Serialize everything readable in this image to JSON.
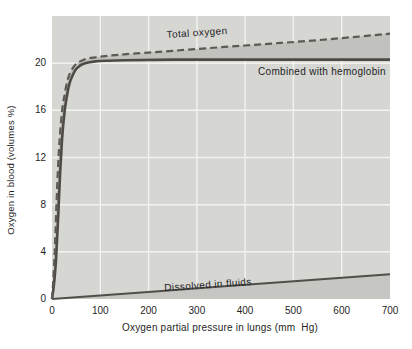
{
  "chart_data": {
    "type": "line",
    "title": "",
    "xlabel": "Oxygen partial pressure in lungs (mm  Hg)",
    "ylabel": "Oxygen in blood (volumes %)",
    "xlim": [
      0,
      700
    ],
    "ylim": [
      0,
      24
    ],
    "x_ticks": [
      0,
      100,
      200,
      300,
      400,
      500,
      600,
      700
    ],
    "y_ticks": [
      0,
      4,
      8,
      12,
      16,
      20
    ],
    "grid": true,
    "legend_position": "inline-curve-labels",
    "series": [
      {
        "name": "Total oxygen",
        "style": "dashed",
        "points": [
          [
            0,
            0
          ],
          [
            2.5,
            1.5
          ],
          [
            5,
            3.5
          ],
          [
            7,
            5.5
          ],
          [
            9,
            7.7
          ],
          [
            11,
            9.8
          ],
          [
            13,
            11.6
          ],
          [
            15,
            13
          ],
          [
            17,
            14.2
          ],
          [
            20,
            15.6
          ],
          [
            23,
            16.6
          ],
          [
            26,
            17.3
          ],
          [
            30,
            18.2
          ],
          [
            34,
            18.8
          ],
          [
            39,
            19.3
          ],
          [
            45,
            19.7
          ],
          [
            52,
            20.0
          ],
          [
            61,
            20.2
          ],
          [
            74,
            20.4
          ],
          [
            90,
            20.5
          ],
          [
            110,
            20.6
          ],
          [
            150,
            20.75
          ],
          [
            250,
            21.05
          ],
          [
            400,
            21.5
          ],
          [
            550,
            21.95
          ],
          [
            700,
            22.5
          ]
        ]
      },
      {
        "name": "Combined with hemoglobin",
        "style": "solid",
        "points": [
          [
            0,
            0
          ],
          [
            4,
            1.2
          ],
          [
            8,
            3.2
          ],
          [
            11,
            5.5
          ],
          [
            13,
            7.2
          ],
          [
            15,
            9
          ],
          [
            17,
            10.8
          ],
          [
            19,
            12.3
          ],
          [
            21,
            13.6
          ],
          [
            24,
            15.1
          ],
          [
            27,
            16.2
          ],
          [
            30,
            17
          ],
          [
            34,
            17.9
          ],
          [
            38,
            18.5
          ],
          [
            43,
            19
          ],
          [
            48,
            19.4
          ],
          [
            55,
            19.7
          ],
          [
            63,
            19.9
          ],
          [
            75,
            20.05
          ],
          [
            90,
            20.15
          ],
          [
            110,
            20.2
          ],
          [
            150,
            20.25
          ],
          [
            250,
            20.3
          ],
          [
            400,
            20.3
          ],
          [
            550,
            20.3
          ],
          [
            700,
            20.3
          ]
        ]
      },
      {
        "name": "Dissolved in fluids",
        "style": "solid",
        "points": [
          [
            0,
            0
          ],
          [
            350,
            1.05
          ],
          [
            700,
            2.1
          ]
        ]
      }
    ],
    "colors": {
      "panel": "#d6d6d3",
      "band": "#c1c1bd",
      "dissolved_area": "#c6c6c2",
      "grid": "#f3f3f0",
      "combined_line": "#4e4a46",
      "total_line": "#5d5955",
      "dissolved_line": "#524e4a",
      "text": "#1f1f1f"
    }
  }
}
